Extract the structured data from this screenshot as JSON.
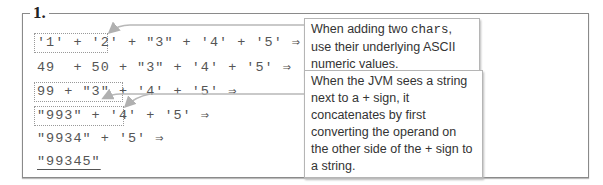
{
  "section_label": "1.",
  "steps": [
    "'1' + '2' + \"3\" + '4' + '5' ⇒",
    "49  + 50 + \"3\" + '4' + '5' ⇒",
    "99 + \"3\" + '4' + '5' ⇒",
    "\"993\" + '4' + '5' ⇒",
    "\"9934\" + '5' ⇒",
    "\"99345\""
  ],
  "callouts": [
    {
      "text_before": "When adding two ",
      "code": "chars",
      "text_after": ", use their underlying ASCII numeric values."
    },
    {
      "text": "When the JVM sees a string next to a + sign, it concatenates by first converting the operand on the other side of the + sign to a string."
    }
  ],
  "colors": {
    "frame": "#8a8a8a",
    "code_text": "#555555",
    "arrow": "#b0b0b0"
  }
}
